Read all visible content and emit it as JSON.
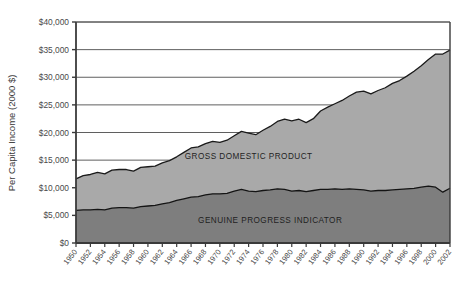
{
  "chart_data": {
    "type": "area",
    "title": "",
    "xlabel": "",
    "ylabel": "Per Capita Income (2000 $)",
    "stacked": false,
    "grid": true,
    "legend_position": "inline-annotation",
    "xlim": [
      1950,
      2002
    ],
    "ylim": [
      0,
      40000
    ],
    "ytick_labels": [
      "$0",
      "$5,000",
      "$10,000",
      "$15,000",
      "$20,000",
      "$25,000",
      "$30,000",
      "$35,000",
      "$40,000"
    ],
    "ytick_values": [
      0,
      5000,
      10000,
      15000,
      20000,
      25000,
      30000,
      35000,
      40000
    ],
    "xtick_labels": [
      "1950",
      "1952",
      "1954",
      "1956",
      "1958",
      "1960",
      "1962",
      "1964",
      "1966",
      "1968",
      "1970",
      "1972",
      "1974",
      "1976",
      "1978",
      "1980",
      "1982",
      "1984",
      "1986",
      "1988",
      "1990",
      "1992",
      "1994",
      "1996",
      "1998",
      "2000",
      "2002"
    ],
    "xtick_values": [
      1950,
      1952,
      1954,
      1956,
      1958,
      1960,
      1962,
      1964,
      1966,
      1968,
      1970,
      1972,
      1974,
      1976,
      1978,
      1980,
      1982,
      1984,
      1986,
      1988,
      1990,
      1992,
      1994,
      1996,
      1998,
      2000,
      2002
    ],
    "x": [
      1950,
      1951,
      1952,
      1953,
      1954,
      1955,
      1956,
      1957,
      1958,
      1959,
      1960,
      1961,
      1962,
      1963,
      1964,
      1965,
      1966,
      1967,
      1968,
      1969,
      1970,
      1971,
      1972,
      1973,
      1974,
      1975,
      1976,
      1977,
      1978,
      1979,
      1980,
      1981,
      1982,
      1983,
      1984,
      1985,
      1986,
      1987,
      1988,
      1989,
      1990,
      1991,
      1992,
      1993,
      1994,
      1995,
      1996,
      1997,
      1998,
      1999,
      2000,
      2001,
      2002
    ],
    "series": [
      {
        "name": "GROSS DOMESTIC PRODUCT",
        "color": "#a9a9a9",
        "line_color": "#1a1a1a",
        "values": [
          11600,
          12200,
          12400,
          12800,
          12500,
          13200,
          13300,
          13300,
          13000,
          13700,
          13800,
          13900,
          14500,
          14900,
          15600,
          16400,
          17200,
          17400,
          18000,
          18400,
          18200,
          18600,
          19400,
          20200,
          19900,
          19600,
          20400,
          21100,
          22000,
          22400,
          22100,
          22400,
          21800,
          22500,
          23900,
          24600,
          25200,
          25800,
          26600,
          27300,
          27500,
          27000,
          27600,
          28100,
          28900,
          29400,
          30200,
          31100,
          32100,
          33200,
          34200,
          34200,
          34900
        ],
        "endpoint_value": 34900
      },
      {
        "name": "GENUINE PROGRESS INDICATOR",
        "color": "#7e7e7e",
        "line_color": "#141414",
        "values": [
          5900,
          6000,
          6000,
          6100,
          6000,
          6300,
          6400,
          6400,
          6300,
          6600,
          6700,
          6800,
          7100,
          7300,
          7700,
          8000,
          8300,
          8400,
          8700,
          8900,
          8900,
          9000,
          9400,
          9700,
          9400,
          9300,
          9500,
          9600,
          9800,
          9700,
          9400,
          9500,
          9300,
          9500,
          9700,
          9700,
          9800,
          9700,
          9800,
          9700,
          9600,
          9400,
          9500,
          9500,
          9600,
          9700,
          9800,
          9900,
          10100,
          10300,
          10100,
          9200,
          9900
        ],
        "endpoint_value": 9900
      }
    ],
    "annotations": [
      {
        "text": "GROSS DOMESTIC PRODUCT",
        "x": 1974,
        "y": 15200
      },
      {
        "text": "GENUINE PROGRESS INDICATOR",
        "x": 1977,
        "y": 3600
      }
    ]
  }
}
